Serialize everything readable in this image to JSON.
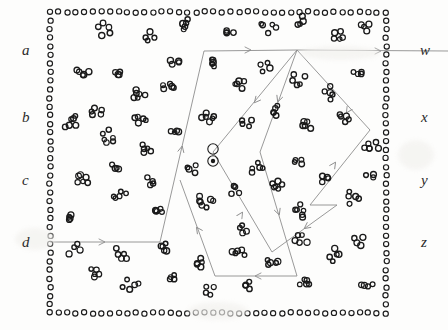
{
  "figure": {
    "width": 448,
    "height": 330,
    "background_color": "#fdfdfc",
    "particle_color": "#1a1a1a",
    "path_color": "#8d8d8d",
    "label_color": "#2a2a2a"
  },
  "labels": {
    "left": [
      {
        "text": "a",
        "x": 22,
        "y": 43
      },
      {
        "text": "b",
        "x": 22,
        "y": 110
      },
      {
        "text": "c",
        "x": 22,
        "y": 173
      },
      {
        "text": "d",
        "x": 22,
        "y": 235
      }
    ],
    "right": [
      {
        "text": "w",
        "x": 420,
        "y": 43
      },
      {
        "text": "x",
        "x": 421,
        "y": 110
      },
      {
        "text": "y",
        "x": 421,
        "y": 173
      },
      {
        "text": "z",
        "x": 421,
        "y": 235
      }
    ]
  },
  "boundary": {
    "name": "dotted-frame",
    "left": 50,
    "top": 12,
    "right": 386,
    "bottom": 313,
    "spacing": 8.6,
    "dot_radius": 2.6
  },
  "marked_particles": [
    {
      "x": 213,
      "y": 149,
      "r": 5.2,
      "filled": false
    },
    {
      "x": 213,
      "y": 161,
      "r": 5.2,
      "filled": true
    }
  ],
  "circuits": [
    {
      "name": "burgers-circuit-left",
      "points": [
        [
          50,
          242
        ],
        [
          160,
          242
        ],
        [
          204,
          51
        ],
        [
          297,
          50
        ],
        [
          260,
          152
        ],
        [
          297,
          276
        ],
        [
          215,
          276
        ],
        [
          180,
          180
        ]
      ],
      "closed": false,
      "arrows": [
        {
          "x": 104,
          "y": 242,
          "angle": 0
        },
        {
          "x": 182,
          "y": 147,
          "angle": -77
        },
        {
          "x": 250,
          "y": 50,
          "angle": 0
        },
        {
          "x": 278,
          "y": 101,
          "angle": 110
        },
        {
          "x": 279,
          "y": 214,
          "angle": 70
        },
        {
          "x": 256,
          "y": 276,
          "angle": 180
        },
        {
          "x": 197,
          "y": 228,
          "angle": -125
        }
      ]
    },
    {
      "name": "burgers-circuit-right",
      "points": [
        [
          448,
          51
        ],
        [
          297,
          50
        ],
        [
          213,
          152
        ],
        [
          272,
          252
        ],
        [
          337,
          205
        ],
        [
          310,
          205
        ],
        [
          370,
          130
        ],
        [
          297,
          50
        ]
      ],
      "closed": false,
      "arrows": [
        {
          "x": 380,
          "y": 51,
          "angle": 0
        },
        {
          "x": 255,
          "y": 102,
          "angle": 130
        },
        {
          "x": 242,
          "y": 213,
          "angle": -58
        },
        {
          "x": 305,
          "y": 228,
          "angle": 143
        },
        {
          "x": 335,
          "y": 163,
          "angle": -56
        },
        {
          "x": 347,
          "y": 112,
          "angle": 122
        }
      ]
    }
  ],
  "clusters": [
    {
      "cx": 104,
      "cy": 30,
      "n": 5,
      "spread": 16
    },
    {
      "cx": 150,
      "cy": 38,
      "n": 4,
      "spread": 13
    },
    {
      "cx": 185,
      "cy": 25,
      "n": 5,
      "spread": 14
    },
    {
      "cx": 228,
      "cy": 33,
      "n": 4,
      "spread": 12
    },
    {
      "cx": 268,
      "cy": 28,
      "n": 5,
      "spread": 15
    },
    {
      "cx": 302,
      "cy": 22,
      "n": 4,
      "spread": 12
    },
    {
      "cx": 337,
      "cy": 36,
      "n": 5,
      "spread": 14
    },
    {
      "cx": 366,
      "cy": 26,
      "n": 4,
      "spread": 12
    },
    {
      "cx": 81,
      "cy": 72,
      "n": 5,
      "spread": 14
    },
    {
      "cx": 118,
      "cy": 73,
      "n": 4,
      "spread": 12
    },
    {
      "cx": 138,
      "cy": 95,
      "n": 6,
      "spread": 17
    },
    {
      "cx": 168,
      "cy": 87,
      "n": 5,
      "spread": 14
    },
    {
      "cx": 175,
      "cy": 62,
      "n": 4,
      "spread": 11
    },
    {
      "cx": 213,
      "cy": 62,
      "n": 5,
      "spread": 14
    },
    {
      "cx": 240,
      "cy": 84,
      "n": 5,
      "spread": 15
    },
    {
      "cx": 265,
      "cy": 68,
      "n": 4,
      "spread": 12
    },
    {
      "cx": 298,
      "cy": 79,
      "n": 5,
      "spread": 14
    },
    {
      "cx": 330,
      "cy": 92,
      "n": 5,
      "spread": 15
    },
    {
      "cx": 358,
      "cy": 73,
      "n": 4,
      "spread": 12
    },
    {
      "cx": 70,
      "cy": 122,
      "n": 6,
      "spread": 16
    },
    {
      "cx": 96,
      "cy": 112,
      "n": 5,
      "spread": 14
    },
    {
      "cx": 108,
      "cy": 138,
      "n": 6,
      "spread": 16
    },
    {
      "cx": 140,
      "cy": 120,
      "n": 5,
      "spread": 14
    },
    {
      "cx": 146,
      "cy": 150,
      "n": 5,
      "spread": 14
    },
    {
      "cx": 175,
      "cy": 131,
      "n": 4,
      "spread": 12
    },
    {
      "cx": 208,
      "cy": 118,
      "n": 6,
      "spread": 17
    },
    {
      "cx": 246,
      "cy": 122,
      "n": 4,
      "spread": 12
    },
    {
      "cx": 276,
      "cy": 110,
      "n": 5,
      "spread": 14
    },
    {
      "cx": 307,
      "cy": 125,
      "n": 5,
      "spread": 15
    },
    {
      "cx": 345,
      "cy": 118,
      "n": 5,
      "spread": 14
    },
    {
      "cx": 370,
      "cy": 148,
      "n": 6,
      "spread": 16
    },
    {
      "cx": 82,
      "cy": 178,
      "n": 6,
      "spread": 17
    },
    {
      "cx": 114,
      "cy": 168,
      "n": 4,
      "spread": 12
    },
    {
      "cx": 120,
      "cy": 196,
      "n": 5,
      "spread": 14
    },
    {
      "cx": 152,
      "cy": 182,
      "n": 4,
      "spread": 11
    },
    {
      "cx": 160,
      "cy": 212,
      "n": 5,
      "spread": 14
    },
    {
      "cx": 192,
      "cy": 170,
      "n": 4,
      "spread": 12
    },
    {
      "cx": 205,
      "cy": 200,
      "n": 7,
      "spread": 18
    },
    {
      "cx": 235,
      "cy": 190,
      "n": 4,
      "spread": 12
    },
    {
      "cx": 255,
      "cy": 168,
      "n": 5,
      "spread": 14
    },
    {
      "cx": 278,
      "cy": 185,
      "n": 6,
      "spread": 16
    },
    {
      "cx": 300,
      "cy": 210,
      "n": 6,
      "spread": 16
    },
    {
      "cx": 326,
      "cy": 178,
      "n": 4,
      "spread": 12
    },
    {
      "cx": 352,
      "cy": 198,
      "n": 5,
      "spread": 14
    },
    {
      "cx": 74,
      "cy": 250,
      "n": 4,
      "spread": 12
    },
    {
      "cx": 96,
      "cy": 272,
      "n": 5,
      "spread": 14
    },
    {
      "cx": 120,
      "cy": 255,
      "n": 5,
      "spread": 14
    },
    {
      "cx": 130,
      "cy": 285,
      "n": 5,
      "spread": 15
    },
    {
      "cx": 164,
      "cy": 248,
      "n": 5,
      "spread": 14
    },
    {
      "cx": 172,
      "cy": 278,
      "n": 4,
      "spread": 12
    },
    {
      "cx": 200,
      "cy": 262,
      "n": 5,
      "spread": 14
    },
    {
      "cx": 210,
      "cy": 290,
      "n": 4,
      "spread": 12
    },
    {
      "cx": 238,
      "cy": 252,
      "n": 5,
      "spread": 14
    },
    {
      "cx": 248,
      "cy": 285,
      "n": 4,
      "spread": 12
    },
    {
      "cx": 272,
      "cy": 262,
      "n": 5,
      "spread": 14
    },
    {
      "cx": 300,
      "cy": 240,
      "n": 5,
      "spread": 14
    },
    {
      "cx": 306,
      "cy": 282,
      "n": 5,
      "spread": 15
    },
    {
      "cx": 335,
      "cy": 255,
      "n": 5,
      "spread": 14
    },
    {
      "cx": 358,
      "cy": 240,
      "n": 4,
      "spread": 12
    },
    {
      "cx": 366,
      "cy": 285,
      "n": 4,
      "spread": 12
    },
    {
      "cx": 70,
      "cy": 218,
      "n": 4,
      "spread": 12
    },
    {
      "cx": 300,
      "cy": 160,
      "n": 4,
      "spread": 12
    },
    {
      "cx": 244,
      "cy": 230,
      "n": 4,
      "spread": 12
    },
    {
      "cx": 372,
      "cy": 175,
      "n": 3,
      "spread": 10
    }
  ],
  "noise_blots": [
    {
      "x": 15,
      "y": 228,
      "w": 40,
      "h": 22
    },
    {
      "x": 188,
      "y": 302,
      "w": 60,
      "h": 18
    },
    {
      "x": 300,
      "y": 46,
      "w": 80,
      "h": 14
    },
    {
      "x": 398,
      "y": 140,
      "w": 36,
      "h": 30
    }
  ]
}
